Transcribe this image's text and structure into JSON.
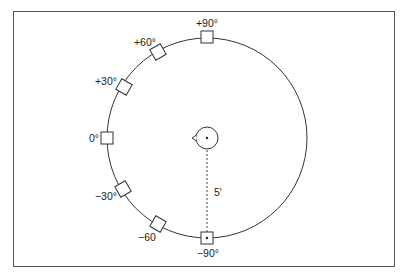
{
  "diagram": {
    "type": "speaker-arc-layout",
    "distance_label": "5'",
    "circle": {
      "cx": 207,
      "cy": 138,
      "r": 100
    },
    "head": {
      "cx": 207,
      "cy": 138,
      "r": 11
    },
    "markers": [
      {
        "label": "+90°",
        "x": 207,
        "y": 37,
        "rot": 0,
        "lx": 207,
        "ly": 27,
        "anchor": "middle"
      },
      {
        "label": "+60°",
        "x": 158,
        "y": 52,
        "rot": -30,
        "lx": 145,
        "ly": 46,
        "anchor": "middle"
      },
      {
        "label": "+30°",
        "x": 124,
        "y": 87,
        "rot": -60,
        "lx": 106,
        "ly": 85,
        "anchor": "middle"
      },
      {
        "label": "0°",
        "x": 107,
        "y": 138,
        "rot": 0,
        "lx": 94,
        "ly": 142,
        "anchor": "middle"
      },
      {
        "label": "−30°",
        "x": 123,
        "y": 189,
        "rot": 60,
        "lx": 106,
        "ly": 200,
        "anchor": "middle"
      },
      {
        "label": "−60",
        "x": 158,
        "y": 224,
        "rot": 30,
        "lx": 147,
        "ly": 241,
        "anchor": "middle"
      },
      {
        "label": "−90°",
        "x": 207,
        "y": 238,
        "rot": 0,
        "lx": 208,
        "ly": 257,
        "anchor": "middle"
      }
    ]
  }
}
